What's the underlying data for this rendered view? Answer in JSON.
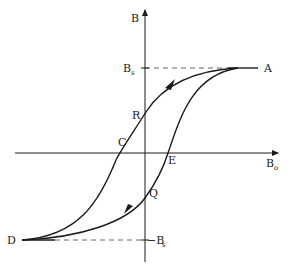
{
  "diagram": {
    "axes": {
      "y_label": "B",
      "x_label_main": "B",
      "x_label_sub": "o"
    },
    "levels": {
      "positive_saturation_main": "B",
      "positive_saturation_sub": "s",
      "negative_saturation_prefix": "−B",
      "negative_saturation_sub": "s"
    },
    "points": {
      "A": "A",
      "R": "R",
      "C": "C",
      "E": "E",
      "Q": "Q",
      "D": "D"
    },
    "colors": {
      "stroke": "#1a1a1a",
      "dashed": "#555555",
      "background": "#ffffff"
    }
  }
}
